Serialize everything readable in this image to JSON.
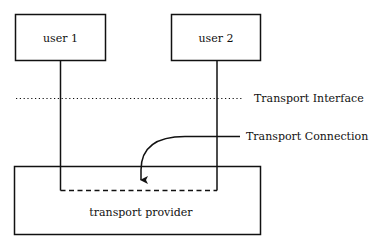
{
  "diagram": {
    "users": [
      {
        "label": "user 1"
      },
      {
        "label": "user 2"
      }
    ],
    "provider": {
      "label": "transport provider"
    },
    "interface_label": "Transport Interface",
    "connection_label": "Transport Connection",
    "colors": {
      "line": "#111111",
      "background": "#ffffff"
    }
  }
}
